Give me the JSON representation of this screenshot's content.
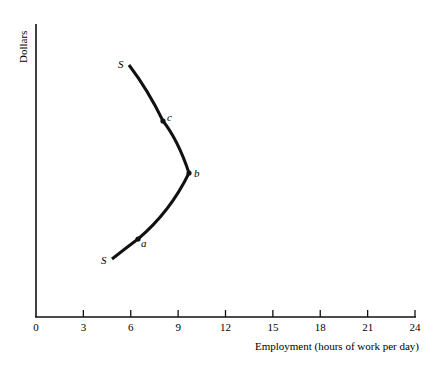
{
  "chart_data": {
    "type": "line",
    "title": "",
    "xlabel": "Employment (hours of work per day)",
    "ylabel": "Dollars",
    "xlim": [
      0,
      24
    ],
    "x_ticks": [
      "0",
      "3",
      "6",
      "9",
      "12",
      "15",
      "18",
      "21",
      "24"
    ],
    "y_ticks": [],
    "grid": false,
    "series": [
      {
        "name": "S",
        "description": "Backward-bending labor supply curve",
        "points": [
          {
            "x": 4.8,
            "y_rel": 0.21,
            "label": "S"
          },
          {
            "x": 6.5,
            "y_rel": 0.3,
            "label": "a"
          },
          {
            "x": 9.7,
            "y_rel": 0.56,
            "label": "b"
          },
          {
            "x": 8.1,
            "y_rel": 0.77,
            "label": "c"
          },
          {
            "x": 6.1,
            "y_rel": 0.98,
            "label": "S"
          }
        ]
      }
    ],
    "annotations": [
      "S",
      "a",
      "b",
      "c",
      "S"
    ]
  }
}
